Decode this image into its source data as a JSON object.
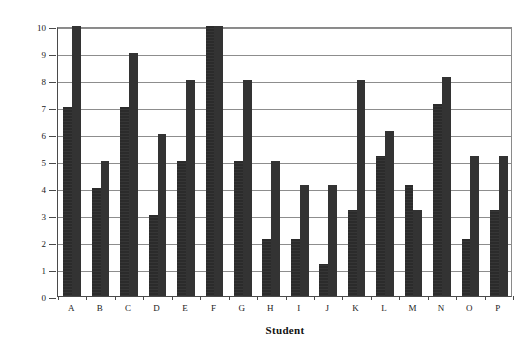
{
  "chart_data": {
    "type": "bar",
    "title": "",
    "xlabel": "Student",
    "ylabel": "Total Score",
    "categories": [
      "A",
      "B",
      "C",
      "D",
      "E",
      "F",
      "G",
      "H",
      "I",
      "J",
      "K",
      "L",
      "M",
      "N",
      "O",
      "P"
    ],
    "series": [
      {
        "name": "Series 1",
        "values": [
          7,
          4,
          7,
          3,
          5,
          10,
          5,
          2.1,
          2.1,
          1.2,
          3.2,
          5.2,
          4.1,
          7.1,
          2.1,
          3.2
        ]
      },
      {
        "name": "Series 2",
        "values": [
          10,
          5,
          9,
          6,
          8,
          10,
          8,
          5,
          4.1,
          4.1,
          8,
          6.1,
          3.2,
          8.1,
          5.2,
          5.2
        ]
      }
    ],
    "ylim": [
      0,
      10
    ],
    "ytick_values": [
      0,
      1,
      2,
      3,
      4,
      5,
      6,
      7,
      8,
      9,
      10
    ],
    "ytick_labels": [
      "0",
      "1",
      "2",
      "3",
      "4",
      "5",
      "6",
      "7",
      "8",
      "9",
      "10"
    ],
    "grid": true,
    "grid_axis": "y",
    "legend": false,
    "legend_position": "none",
    "bar_color": "#2b2b2b",
    "grid_color": "#8d8d8d",
    "axis_color": "#4a4a4a",
    "background": "#ffffff"
  }
}
